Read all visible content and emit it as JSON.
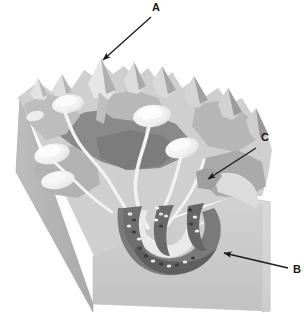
{
  "figure": {
    "type": "geomorphology-block-diagram",
    "background_color": "#ffffff",
    "width": 306,
    "height": 314
  },
  "callouts": [
    {
      "id": "A",
      "label": "A",
      "label_x": 157,
      "label_y": 8,
      "arrow_from": [
        151,
        17
      ],
      "arrow_to": [
        101,
        62
      ],
      "points_to": "sharp-mountain-peak-horn"
    },
    {
      "id": "C",
      "label": "C",
      "label_x": 265,
      "label_y": 138,
      "arrow_from": [
        256,
        148
      ],
      "arrow_to": [
        206,
        181
      ],
      "points_to": "glacial-valley-cirque-right"
    },
    {
      "id": "B",
      "label": "B",
      "label_x": 297,
      "label_y": 270,
      "arrow_from": [
        288,
        268
      ],
      "arrow_to": [
        222,
        252
      ],
      "points_to": "terminal-moraine-valley-floor"
    }
  ],
  "palette": {
    "ink": "#1a1a1a",
    "block_front_face": "#c9c9c9",
    "block_left_face": "#b4b4b4",
    "block_right_face": "#d2d2d2",
    "terrain_light": "#d6d6d6",
    "terrain_mid": "#b0b0b0",
    "terrain_dark": "#8d8d8d",
    "terrain_darkest": "#787878",
    "snow_white": "#f4f4f4",
    "stream_white": "#efefef",
    "moraine_dark": "#6f6f6f",
    "boulder_light": "#e8e8e8",
    "boulder_dark": "#3a3a3a"
  },
  "features": {
    "peaks": "serrated ridge of horns and aretes along the skyline",
    "cirques": "bowl-shaped white hollows on the upper slopes",
    "valley_glaciers": "pale tongues converging down the main trough",
    "moraines": "dark debris bands with scattered boulders on the valley floor"
  }
}
